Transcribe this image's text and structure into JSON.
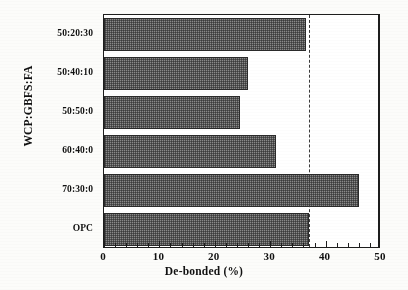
{
  "chart_data": {
    "type": "bar",
    "orientation": "horizontal",
    "title": "",
    "xlabel": "De-bonded (%)",
    "ylabel": "WCP:GBFS:FA",
    "categories": [
      "50:20:30",
      "50:40:10",
      "50:50:0",
      "60:40:0",
      "70:30:0",
      "OPC"
    ],
    "values": [
      36.5,
      26,
      24.5,
      31,
      46,
      37
    ],
    "xlim": [
      0,
      50
    ],
    "xticks": [
      0,
      10,
      20,
      30,
      40,
      50
    ],
    "xtick_labels": [
      "0",
      "10",
      "20",
      "30",
      "40",
      "50"
    ],
    "xminor_step": 2,
    "grid": false,
    "legend": null,
    "annotations": [
      {
        "name": "opc-reference-line",
        "type": "vertical-dashed-line",
        "value": 37,
        "label": ""
      }
    ],
    "bar_fill": "#8a8a8a",
    "bar_pattern": "cross-hatch",
    "bar_edge_color": "#2a2a2a",
    "axis_color": "#1d1d1d"
  },
  "figure": {
    "background": "#fcfcfa",
    "frame_color": "#1d1d1d"
  }
}
